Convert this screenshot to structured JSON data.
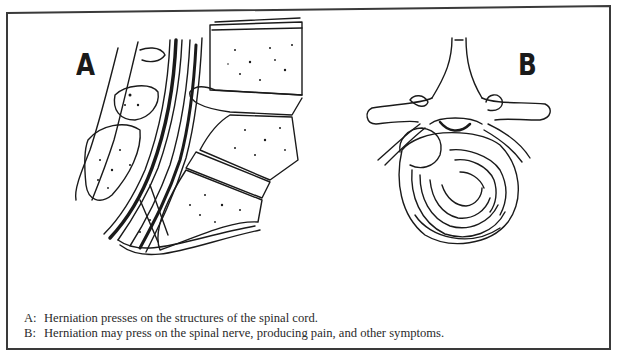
{
  "figure": {
    "panels": [
      {
        "id": "A",
        "label": "A",
        "view": "sagittal",
        "subject": "lumbar spine with herniated disc pressing on spinal cord structures"
      },
      {
        "id": "B",
        "label": "B",
        "view": "axial",
        "subject": "vertebra and disc with herniation pressing on spinal nerve"
      }
    ],
    "caption": [
      {
        "key": "A:",
        "text": "Herniation presses on the structures of the spinal cord."
      },
      {
        "key": "B:",
        "text": "Herniation may press on the spinal nerve, producing pain, and other symptoms."
      }
    ],
    "colors": {
      "ink": "#1a1a1a",
      "paper": "#ffffff",
      "frame": "#3a3a3a",
      "caption_text": "#2a2a2a"
    }
  }
}
